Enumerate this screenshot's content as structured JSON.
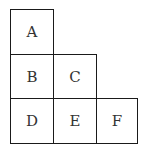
{
  "diagram": {
    "type": "staircase-grid",
    "cells": [
      {
        "label": "A",
        "row": 0,
        "col": 0
      },
      {
        "label": "B",
        "row": 1,
        "col": 0
      },
      {
        "label": "C",
        "row": 1,
        "col": 1
      },
      {
        "label": "D",
        "row": 2,
        "col": 0
      },
      {
        "label": "E",
        "row": 2,
        "col": 1
      },
      {
        "label": "F",
        "row": 2,
        "col": 2
      }
    ]
  }
}
